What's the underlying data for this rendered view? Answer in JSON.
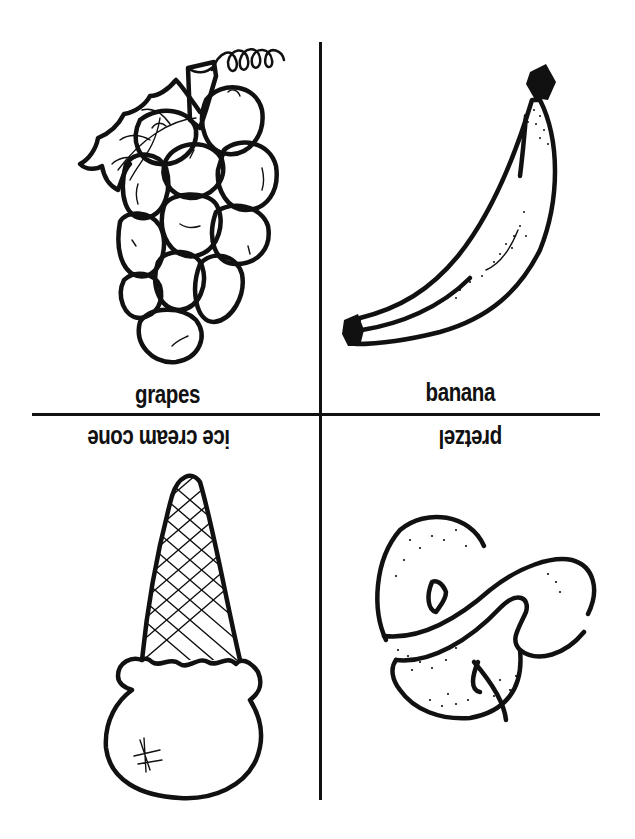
{
  "page": {
    "type": "coloring-page",
    "background": "#ffffff",
    "ink_color": "#111111"
  },
  "panels": [
    {
      "id": "top-left",
      "label": "grapes",
      "icon": "grapes-icon",
      "orientation": "upright"
    },
    {
      "id": "top-right",
      "label": "banana",
      "icon": "banana-icon",
      "orientation": "upright"
    },
    {
      "id": "bottom-left",
      "label": "ice cream cone",
      "icon": "ice-cream-cone-icon",
      "orientation": "upside-down"
    },
    {
      "id": "bottom-right",
      "label": "pretzel",
      "icon": "pretzel-icon",
      "orientation": "upside-down"
    }
  ]
}
